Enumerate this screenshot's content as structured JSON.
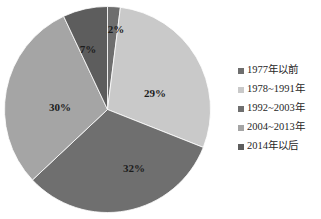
{
  "chart_data": {
    "type": "pie",
    "title": "",
    "labels": [
      "1977年以前",
      "1978~1991年",
      "1992~2003年",
      "2004~2013年",
      "2014年以后"
    ],
    "values": [
      2,
      29,
      32,
      30,
      7
    ],
    "value_labels": [
      "2%",
      "29%",
      "32%",
      "30%",
      "7%"
    ],
    "colors": [
      "#6e6e6e",
      "#c9c9c9",
      "#6f6f6f",
      "#a5a5a5",
      "#5d5d5d"
    ],
    "start_angle_deg": 0,
    "direction": "clockwise",
    "legend_position": "right",
    "grid": false,
    "xlabel": "",
    "ylabel": ""
  },
  "legend": {
    "items": [
      {
        "label": "1977年以前",
        "marker_color": "#6e6e6e"
      },
      {
        "label": "1978~1991年",
        "marker_color": "#c9c9c9"
      },
      {
        "label": "1992~2003年",
        "marker_color": "#6f6f6f"
      },
      {
        "label": "2004~2013年",
        "marker_color": "#a5a5a5"
      },
      {
        "label": "2014年以后",
        "marker_color": "#5d5d5d"
      }
    ]
  },
  "pie": {
    "slices": [
      {
        "name": "1977年以前",
        "percent_label": "2%",
        "value": 2,
        "color": "#6e6e6e",
        "label_x": 112,
        "label_y": 24
      },
      {
        "name": "1978~1991年",
        "percent_label": "29%",
        "value": 29,
        "color": "#c9c9c9",
        "label_x": 151,
        "label_y": 88
      },
      {
        "name": "1992~2003年",
        "percent_label": "32%",
        "value": 32,
        "color": "#6f6f6f",
        "label_x": 130,
        "label_y": 163
      },
      {
        "name": "2004~2013年",
        "percent_label": "30%",
        "value": 30,
        "color": "#a5a5a5",
        "label_x": 56,
        "label_y": 102
      },
      {
        "name": "2014年以后",
        "percent_label": "7%",
        "value": 7,
        "color": "#5d5d5d",
        "label_x": 84,
        "label_y": 44
      }
    ]
  }
}
